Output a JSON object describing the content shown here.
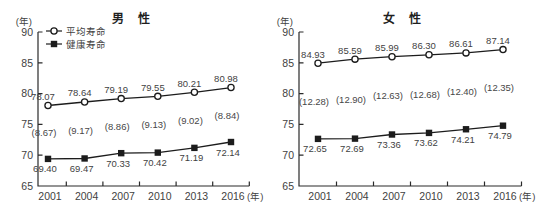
{
  "figure": {
    "background": "#ffffff",
    "colors": {
      "line": "#1c1c1c",
      "axis": "#2a2a2a",
      "text": "#3f3f3f",
      "gap_text": "#474747",
      "marker_fill_open": "#ffffff"
    }
  },
  "chart_data": [
    {
      "type": "line",
      "title": "男 性",
      "y_axis_unit": "(年)",
      "x_axis_unit": "(年)",
      "categories": [
        "2001",
        "2004",
        "2007",
        "2010",
        "2013",
        "2016"
      ],
      "ylim": [
        65,
        90
      ],
      "yticks": [
        65,
        70,
        75,
        80,
        85,
        90
      ],
      "grid": false,
      "legend": {
        "visible": true,
        "position": "top-left",
        "items": [
          {
            "label": "平均寿命",
            "marker": "open-circle"
          },
          {
            "label": "健康寿命",
            "marker": "filled-square"
          }
        ]
      },
      "series": [
        {
          "name": "平均寿命",
          "marker": "open-circle",
          "label_side": "above",
          "values": [
            78.07,
            78.64,
            79.19,
            79.55,
            80.21,
            80.98
          ],
          "labels": [
            "78.07",
            "78.64",
            "79.19",
            "79.55",
            "80.21",
            "80.98"
          ]
        },
        {
          "name": "健康寿命",
          "marker": "filled-square",
          "label_side": "below",
          "values": [
            69.4,
            69.47,
            70.33,
            70.42,
            71.19,
            72.14
          ],
          "labels": [
            "69.40",
            "69.47",
            "70.33",
            "70.42",
            "71.19",
            "72.14"
          ]
        }
      ],
      "gap_labels": [
        "(8.67)",
        "(9.17)",
        "(8.86)",
        "(9.13)",
        "(9.02)",
        "(8.84)"
      ]
    },
    {
      "type": "line",
      "title": "女 性",
      "y_axis_unit": "(年)",
      "x_axis_unit": "(年)",
      "categories": [
        "2001",
        "2004",
        "2007",
        "2010",
        "2013",
        "2016"
      ],
      "ylim": [
        65,
        90
      ],
      "yticks": [
        65,
        70,
        75,
        80,
        85,
        90
      ],
      "grid": false,
      "legend": {
        "visible": false,
        "items": []
      },
      "series": [
        {
          "name": "平均寿命",
          "marker": "open-circle",
          "label_side": "above",
          "values": [
            84.93,
            85.59,
            85.99,
            86.3,
            86.61,
            87.14
          ],
          "labels": [
            "84.93",
            "85.59",
            "85.99",
            "86.30",
            "86.61",
            "87.14"
          ]
        },
        {
          "name": "健康寿命",
          "marker": "filled-square",
          "label_side": "below",
          "values": [
            72.65,
            72.69,
            73.36,
            73.62,
            74.21,
            74.79
          ],
          "labels": [
            "72.65",
            "72.69",
            "73.36",
            "73.62",
            "74.21",
            "74.79"
          ]
        }
      ],
      "gap_labels": [
        "(12.28)",
        "(12.90)",
        "(12.63)",
        "(12.68)",
        "(12.40)",
        "(12.35)"
      ]
    }
  ]
}
